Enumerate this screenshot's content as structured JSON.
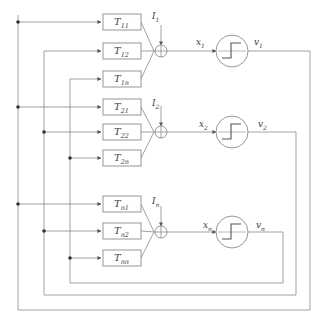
{
  "diagram": {
    "stroke_color": "#8a8a8a",
    "text_color": "#3d3d3d",
    "box_fill": "#ffffff"
  },
  "weight_boxes": [
    {
      "name": "T-11",
      "label": "T",
      "sub": "11",
      "x": 103,
      "y": 14,
      "w": 38,
      "h": 16
    },
    {
      "name": "T-12",
      "label": "T",
      "sub": "12",
      "x": 103,
      "y": 43,
      "w": 38,
      "h": 16
    },
    {
      "name": "T-1n",
      "label": "T",
      "sub": "1n",
      "x": 103,
      "y": 71,
      "w": 38,
      "h": 16
    },
    {
      "name": "T-21",
      "label": "T",
      "sub": "21",
      "x": 103,
      "y": 99,
      "w": 38,
      "h": 16
    },
    {
      "name": "T-22",
      "label": "T",
      "sub": "22",
      "x": 103,
      "y": 124,
      "w": 38,
      "h": 16
    },
    {
      "name": "T-2n",
      "label": "T",
      "sub": "2n",
      "x": 103,
      "y": 150,
      "w": 38,
      "h": 16
    },
    {
      "name": "T-n1",
      "label": "T",
      "sub": "n1",
      "x": 103,
      "y": 196,
      "w": 38,
      "h": 16
    },
    {
      "name": "T-n2",
      "label": "T",
      "sub": "n2",
      "x": 103,
      "y": 223,
      "w": 38,
      "h": 16
    },
    {
      "name": "T-nn",
      "label": "T",
      "sub": "nn",
      "x": 103,
      "y": 250,
      "w": 38,
      "h": 16
    }
  ],
  "summing_junctions": [
    {
      "name": "sum-1",
      "cx": 161,
      "cy": 51,
      "r": 6
    },
    {
      "name": "sum-2",
      "cx": 161,
      "cy": 132,
      "r": 6
    },
    {
      "name": "sum-3",
      "cx": 161,
      "cy": 232,
      "r": 6
    }
  ],
  "neurons": [
    {
      "name": "neuron-1",
      "cx": 232,
      "cy": 51,
      "r": 16
    },
    {
      "name": "neuron-2",
      "cx": 232,
      "cy": 132,
      "r": 16
    },
    {
      "name": "neuron-3",
      "cx": 232,
      "cy": 232,
      "r": 16
    }
  ],
  "external_inputs": [
    {
      "name": "I-1",
      "label": "I",
      "sub": "1",
      "x": 152,
      "y": 12
    },
    {
      "name": "I-2",
      "label": "I",
      "sub": "2",
      "x": 152,
      "y": 99
    },
    {
      "name": "I-n",
      "label": "I",
      "sub": "n",
      "x": 152,
      "y": 197
    }
  ],
  "state_labels": [
    {
      "name": "x-1",
      "label": "x",
      "sub": "1",
      "x": 196,
      "y": 38
    },
    {
      "name": "x-2",
      "label": "x",
      "sub": "2",
      "x": 199,
      "y": 120
    },
    {
      "name": "x-n",
      "label": "x",
      "sub": "n",
      "x": 203,
      "y": 221
    }
  ],
  "output_labels": [
    {
      "name": "v-1",
      "label": "v",
      "sub": "1",
      "x": 254,
      "y": 38
    },
    {
      "name": "v-2",
      "label": "v",
      "sub": "2",
      "x": 258,
      "y": 120
    },
    {
      "name": "v-n",
      "label": "v",
      "sub": "n",
      "x": 256,
      "y": 221
    }
  ],
  "feedback_buses": [
    {
      "name": "feedback-bus-1",
      "bus_x": 18,
      "return_x": 310,
      "bottom_y": 310,
      "top_y": 15,
      "targets_y": [
        22,
        107,
        204
      ]
    },
    {
      "name": "feedback-bus-2",
      "bus_x": 44,
      "return_x": 296,
      "bottom_y": 295,
      "top_y": 51,
      "targets_y": [
        51,
        132,
        231
      ]
    },
    {
      "name": "feedback-bus-3",
      "bus_x": 70,
      "return_x": 283,
      "bottom_y": 283,
      "top_y": 79,
      "targets_y": [
        79,
        158,
        258
      ]
    }
  ]
}
